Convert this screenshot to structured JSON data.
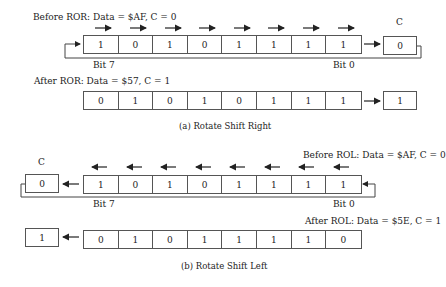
{
  "ror": {
    "before_title": "Before ROR: Data = $AF, C = 0",
    "before_bits": [
      "1",
      "0",
      "1",
      "0",
      "1",
      "1",
      "1",
      "1"
    ],
    "before_carry": "0",
    "carry_label": "C",
    "bit7_label": "Bit 7",
    "bit0_label": "Bit 0",
    "after_title": "After ROR: Data = $57, C = 1",
    "after_bits": [
      "0",
      "1",
      "0",
      "1",
      "0",
      "1",
      "1",
      "1"
    ],
    "after_carry": "1",
    "caption": "(a) Rotate Shift Right"
  },
  "rol": {
    "before_title": "Before ROL: Data = $AF, C = 0",
    "before_bits": [
      "1",
      "0",
      "1",
      "0",
      "1",
      "1",
      "1",
      "1"
    ],
    "before_carry": "0",
    "carry_label": "C",
    "bit7_label": "Bit 7",
    "bit0_label": "Bit 0",
    "after_title": "After ROL: Data = $5E, C = 1",
    "after_bits": [
      "0",
      "1",
      "0",
      "1",
      "1",
      "1",
      "1",
      "0"
    ],
    "after_carry": "1",
    "caption": "(b) Rotate Shift Left"
  }
}
